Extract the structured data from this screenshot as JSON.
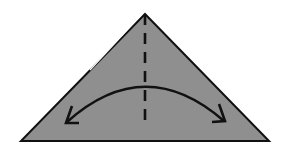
{
  "diagram": {
    "type": "origami-fold-step",
    "shape": "triangle",
    "colors": {
      "fill": "#8f8f8f",
      "stroke": "#111111",
      "background": "#ffffff"
    },
    "elements": [
      {
        "name": "paper-triangle",
        "kind": "triangle"
      },
      {
        "name": "valley-fold-line",
        "kind": "dashed-line",
        "orientation": "vertical"
      },
      {
        "name": "fold-arrow",
        "kind": "double-headed-curved-arrow"
      }
    ]
  }
}
